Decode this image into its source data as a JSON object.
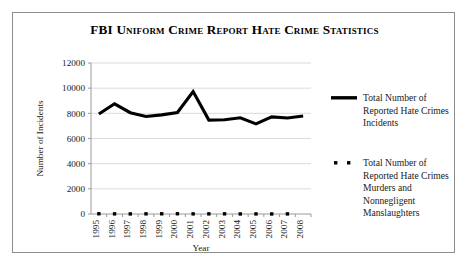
{
  "chart_data": {
    "type": "line",
    "title": "FBI Uniform Crime Report Hate Crime Statistics",
    "xlabel": "Year",
    "ylabel": "Number of Incidents",
    "categories": [
      "1995",
      "1996",
      "1997",
      "1998",
      "1999",
      "2000",
      "2001",
      "2002",
      "2003",
      "2004",
      "2005",
      "2006",
      "2007",
      "2008"
    ],
    "ylim": [
      0,
      12000
    ],
    "ytick_labels": [
      "0",
      "2000",
      "4000",
      "6000",
      "8000",
      "10000",
      "12000"
    ],
    "ytick_values": [
      0,
      2000,
      4000,
      6000,
      8000,
      10000,
      12000
    ],
    "grid": true,
    "legend_position": "right",
    "series": [
      {
        "name": "Total Number of Reported Hate Crimes Incidents",
        "legend_lines": [
          "Total Number of",
          "Reported Hate Crimes",
          "Incidents"
        ],
        "marker": "line",
        "color": "#000000",
        "values": [
          7947,
          8759,
          8049,
          7755,
          7876,
          8063,
          9730,
          7462,
          7489,
          7649,
          7163,
          7722,
          7624,
          7783
        ]
      },
      {
        "name": "Total Number of Reported Hate Crimes Murders and Nonnegligent Manslaughters",
        "legend_lines": [
          "Total Number of",
          "Reported Hate Crimes",
          "Murders and",
          "Nonnegligent",
          "Manslaughters"
        ],
        "marker": "dot",
        "color": "#000000",
        "values": [
          20,
          12,
          8,
          13,
          17,
          19,
          10,
          11,
          14,
          5,
          6,
          3,
          9,
          null
        ]
      }
    ]
  },
  "layout": {
    "plot_left": 78,
    "plot_right": 298,
    "plot_top": 50,
    "plot_bottom": 201,
    "legend_x": 318,
    "legend_entry1_y": 88,
    "legend_entry2_y": 153,
    "legend_line_height": 12.6
  },
  "colors": {
    "frame": "#8e8e8e",
    "grid": "#d2d2d2",
    "axis": "#9a9a9a",
    "series": "#000000",
    "background": "#ffffff"
  }
}
